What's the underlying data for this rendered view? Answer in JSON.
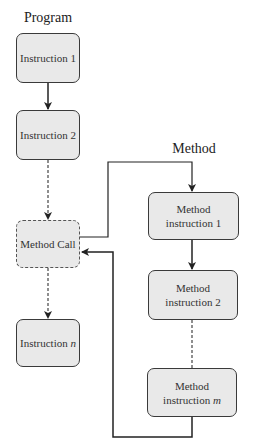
{
  "labels": {
    "program": "Program",
    "method": "Method"
  },
  "program_nodes": [
    {
      "id": "instruction-1",
      "text": "Instruction 1"
    },
    {
      "id": "instruction-2",
      "text": "Instruction 2"
    },
    {
      "id": "method-call",
      "text": "Method Call",
      "style": "dashed"
    },
    {
      "id": "instruction-n",
      "text": "Instruction ",
      "italic_suffix": "n"
    }
  ],
  "method_nodes": [
    {
      "id": "method-instruction-1",
      "line1": "Method",
      "line2": "instruction 1"
    },
    {
      "id": "method-instruction-2",
      "line1": "Method",
      "line2": "instruction 2"
    },
    {
      "id": "method-instruction-m",
      "line1": "Method",
      "line2": "instruction ",
      "italic_suffix": "m"
    }
  ],
  "edges": [
    {
      "from": "instruction-1",
      "to": "instruction-2",
      "style": "solid"
    },
    {
      "from": "instruction-2",
      "to": "method-call",
      "style": "dashed"
    },
    {
      "from": "method-call",
      "to": "instruction-n",
      "style": "dashed"
    },
    {
      "from": "method-call",
      "to": "method-instruction-1",
      "style": "solid"
    },
    {
      "from": "method-instruction-1",
      "to": "method-instruction-2",
      "style": "solid"
    },
    {
      "from": "method-instruction-2",
      "to": "method-instruction-m",
      "style": "dashed"
    },
    {
      "from": "method-instruction-m",
      "to": "method-call",
      "style": "solid"
    }
  ],
  "colors": {
    "box_fill": "#e9e9e9",
    "box_border": "#3a3a3a",
    "line": "#222222"
  }
}
